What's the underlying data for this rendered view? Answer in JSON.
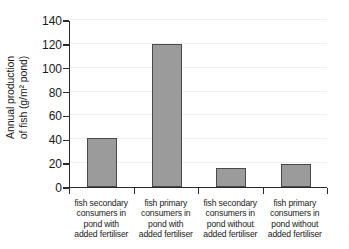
{
  "chart_data": {
    "type": "bar",
    "title": "",
    "xlabel": "",
    "ylabel": "Annual production of fish (g/m2 pond)",
    "ylabel_line1": "Annual production",
    "ylabel_line2": "of fish (g/m² pond)",
    "ylim": [
      0,
      140
    ],
    "ytick_values": [
      0,
      20,
      40,
      60,
      80,
      100,
      120,
      140
    ],
    "ytick_labels": [
      "0",
      "20",
      "40",
      "60",
      "80",
      "100",
      "120",
      "140"
    ],
    "grid": true,
    "legend": "none",
    "bar_color": "#9b9b9b",
    "bar_edge_color": "#4a4a4a",
    "axis_color": "#2b2b2b",
    "categories": [
      "fish secondary consumers in pond with added fertiliser",
      "fish primary consumers in pond with added fertiliser",
      "fish secondary consumers in pond without added fertiliser",
      "fish primary consumers in pond without added fertiliser"
    ],
    "category_lines": [
      [
        "fish secondary",
        "consumers in",
        "pond with",
        "added fertiliser"
      ],
      [
        "fish primary",
        "consumers in",
        "pond with",
        "added fertiliser"
      ],
      [
        "fish secondary",
        "consumers in",
        "pond without",
        "added fertiliser"
      ],
      [
        "fish primary",
        "consumers in",
        "pond without",
        "added fertiliser"
      ]
    ],
    "values": [
      41,
      120,
      16,
      19
    ]
  }
}
